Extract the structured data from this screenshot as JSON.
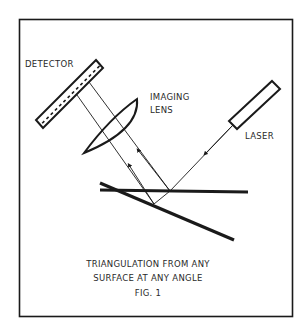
{
  "figure": {
    "labels": {
      "detector": "DETECTOR",
      "imaging_lens_line1": "IMAGING",
      "imaging_lens_line2": "LENS",
      "laser": "LASER"
    },
    "caption": {
      "line1": "TRIANGULATION FROM ANY",
      "line2": "SURFACE AT ANY ANGLE",
      "figure_number": "FIG. 1"
    },
    "colors": {
      "ink": "#1a1a1a",
      "background": "#ffffff"
    }
  }
}
